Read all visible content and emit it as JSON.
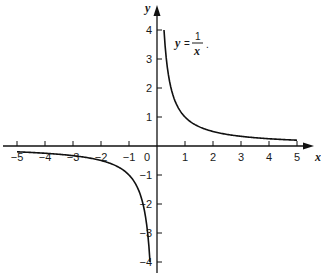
{
  "chart_data": {
    "type": "line",
    "title": "",
    "xlabel": "x",
    "ylabel": "y",
    "xlim": [
      -5.5,
      5.5
    ],
    "ylim": [
      -4.4,
      4.5
    ],
    "grid": false,
    "legend": null,
    "x_ticks": [
      -5,
      -4,
      -3,
      -2,
      -1,
      0,
      1,
      2,
      3,
      4,
      5
    ],
    "y_ticks": [
      -4,
      -3,
      -2,
      -1,
      1,
      2,
      3,
      4
    ],
    "annotation": {
      "text": "y = 1/x",
      "lhs": "y",
      "numerator": "1",
      "denominator": "x",
      "trailing": "."
    },
    "series": [
      {
        "name": "y = 1/x (x > 0)",
        "x": [
          0.25,
          0.3,
          0.4,
          0.5,
          0.75,
          1,
          1.5,
          2,
          2.5,
          3,
          4,
          5
        ],
        "y": [
          4,
          3.33,
          2.5,
          2,
          1.33,
          1,
          0.67,
          0.5,
          0.4,
          0.33,
          0.25,
          0.2
        ]
      },
      {
        "name": "y = 1/x (x < 0)",
        "x": [
          -5,
          -4,
          -3,
          -2.5,
          -2,
          -1.5,
          -1,
          -0.75,
          -0.5,
          -0.4,
          -0.3,
          -0.25
        ],
        "y": [
          -0.2,
          -0.25,
          -0.33,
          -0.4,
          -0.5,
          -0.67,
          -1,
          -1.33,
          -2,
          -2.5,
          -3.33,
          -4
        ]
      }
    ],
    "colors": {
      "curve": "#111111",
      "axis": "#111111",
      "text": "#1a1a1a"
    }
  }
}
